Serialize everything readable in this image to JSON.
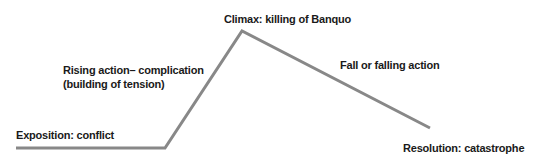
{
  "chart_data": {
    "type": "line",
    "title": "",
    "points": [
      {
        "x": 16,
        "y": 148
      },
      {
        "x": 165,
        "y": 148
      },
      {
        "x": 242,
        "y": 31
      },
      {
        "x": 430,
        "y": 128
      }
    ],
    "line_color": "#888888",
    "labels": {
      "exposition": "Exposition: conflict",
      "rising_1": "Rising action– complication",
      "rising_2": "(building of tension)",
      "climax": "Climax: killing of Banquo",
      "falling": "Fall or falling action",
      "resolution": "Resolution: catastrophe"
    }
  }
}
